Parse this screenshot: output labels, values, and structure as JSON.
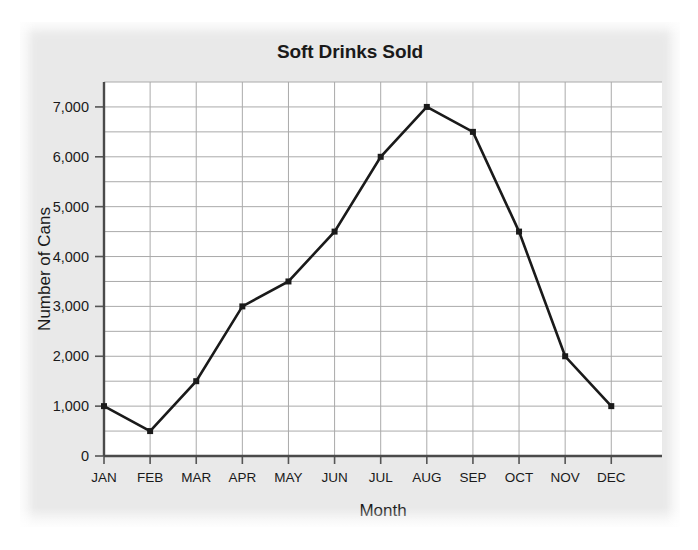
{
  "chart_data": {
    "type": "line",
    "title": "Soft Drinks Sold",
    "xlabel": "Month",
    "ylabel": "Number of Cans",
    "categories": [
      "JAN",
      "FEB",
      "MAR",
      "APR",
      "MAY",
      "JUN",
      "JUL",
      "AUG",
      "SEP",
      "OCT",
      "NOV",
      "DEC"
    ],
    "values": [
      1000,
      500,
      1500,
      3000,
      3500,
      4500,
      6000,
      7000,
      6500,
      4500,
      2000,
      1000
    ],
    "series": [
      {
        "name": "Soft Drinks Sold",
        "values": [
          1000,
          500,
          1500,
          3000,
          3500,
          4500,
          6000,
          7000,
          6500,
          4500,
          2000,
          1000
        ]
      }
    ],
    "ylim": [
      0,
      7500
    ],
    "xlim": [
      0,
      12
    ],
    "ytick_values": [
      0,
      1000,
      2000,
      3000,
      4000,
      5000,
      6000,
      7000
    ],
    "ytick_labels": [
      "0",
      "1,000",
      "2,000",
      "3,000",
      "4,000",
      "5,000",
      "6,000",
      "7,000"
    ],
    "yminor_step": 500,
    "grid": true,
    "grid_axes": "both",
    "legend": false,
    "legend_position": "none",
    "marker": "square",
    "line_color": "#1a1a1a",
    "grid_color": "#aaaaaa",
    "plot_background": "#ffffff",
    "figure_background": "#e9e9e9"
  }
}
